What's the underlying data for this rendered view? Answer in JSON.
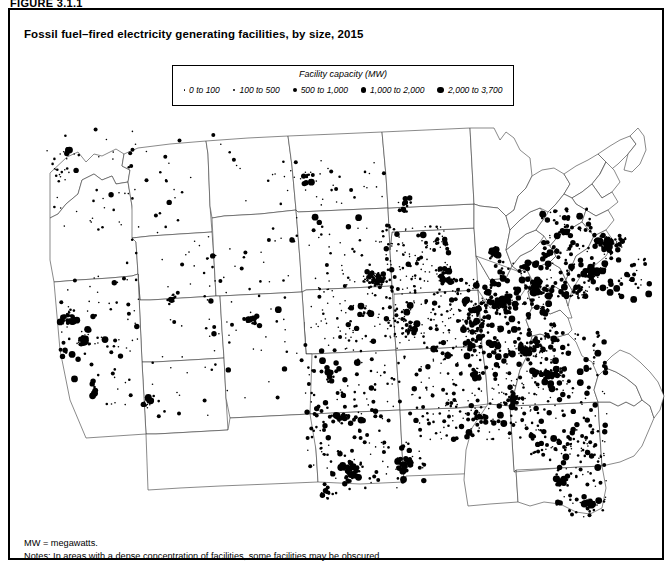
{
  "figure_label": "FIGURE 3.1.1",
  "title": "Fossil fuel–fired electricity generating facilities, by size, 2015",
  "legend": {
    "title": "Facility capacity (MW)",
    "items": [
      {
        "label": "0 to 100",
        "size": 1.6
      },
      {
        "label": "100 to 500",
        "size": 2.6
      },
      {
        "label": "500 to 1,000",
        "size": 4.0
      },
      {
        "label": "1,000 to 2,000",
        "size": 5.2
      },
      {
        "label": "2,000 to 3,700",
        "size": 6.6
      }
    ]
  },
  "notes": {
    "abbreviation": "MW = megawatts.",
    "note": "Notes: In areas with a dense concentration of facilities, some facilities may be obscured."
  },
  "colors": {
    "dot": "#000000",
    "state_border": "#3a3a3a",
    "country_outline": "#1a1a1a",
    "frame": "#000000",
    "background": "#ffffff"
  },
  "chart_data": {
    "type": "scatter",
    "title": "Fossil fuel–fired electricity generating facilities, by size, 2015",
    "xlabel": "",
    "ylabel": "",
    "projection": "conic United States (lower 48)",
    "legend_position": "top-center",
    "grid": false,
    "size_classes": [
      {
        "range_mw": [
          0,
          100
        ],
        "label": "0 to 100",
        "radius_px": 0.8
      },
      {
        "range_mw": [
          100,
          500
        ],
        "label": "100 to 500",
        "radius_px": 1.3
      },
      {
        "range_mw": [
          500,
          1000
        ],
        "label": "500 to 1,000",
        "radius_px": 2.0
      },
      {
        "range_mw": [
          1000,
          2000
        ],
        "label": "1,000 to 2,000",
        "radius_px": 2.7
      },
      {
        "range_mw": [
          2000,
          3700
        ],
        "label": "2,000 to 3,700",
        "radius_px": 3.4
      }
    ],
    "regions": [
      {
        "name": "Pacific Northwest",
        "density": "low",
        "approx_count": 40
      },
      {
        "name": "California",
        "density": "high",
        "approx_count": 190
      },
      {
        "name": "Desert Southwest",
        "density": "medium",
        "approx_count": 95
      },
      {
        "name": "Northern Rockies / Plains",
        "density": "very low",
        "approx_count": 55
      },
      {
        "name": "Midwest Corn Belt",
        "density": "very high",
        "approx_count": 300
      },
      {
        "name": "Texas Gulf Coast",
        "density": "very high",
        "approx_count": 210
      },
      {
        "name": "Southeast",
        "density": "high",
        "approx_count": 260
      },
      {
        "name": "Florida",
        "density": "high",
        "approx_count": 95
      },
      {
        "name": "Ohio Valley / Appalachia",
        "density": "very high",
        "approx_count": 320
      },
      {
        "name": "Northeast Corridor",
        "density": "very high",
        "approx_count": 340
      },
      {
        "name": "Great Lakes",
        "density": "high",
        "approx_count": 180
      }
    ],
    "clusters": [
      {
        "name": "Los Angeles Basin",
        "x": 0.105,
        "y": 0.68,
        "count": 46,
        "weight": "heavy"
      },
      {
        "name": "San Francisco Bay",
        "x": 0.072,
        "y": 0.505,
        "count": 30,
        "weight": "heavy"
      },
      {
        "name": "Central Valley",
        "x": 0.098,
        "y": 0.56,
        "count": 26,
        "weight": "medium"
      },
      {
        "name": "San Diego / Imperial",
        "x": 0.125,
        "y": 0.735,
        "count": 14,
        "weight": "medium"
      },
      {
        "name": "Phoenix",
        "x": 0.196,
        "y": 0.71,
        "count": 20,
        "weight": "heavy"
      },
      {
        "name": "Seattle / Puget Sound",
        "x": 0.072,
        "y": 0.1,
        "count": 12,
        "weight": "medium"
      },
      {
        "name": "Portland",
        "x": 0.062,
        "y": 0.155,
        "count": 9,
        "weight": "light"
      },
      {
        "name": "Salt Lake City",
        "x": 0.232,
        "y": 0.455,
        "count": 14,
        "weight": "medium"
      },
      {
        "name": "Denver / Front Range",
        "x": 0.352,
        "y": 0.505,
        "count": 20,
        "weight": "medium"
      },
      {
        "name": "Houston Ship Channel",
        "x": 0.508,
        "y": 0.875,
        "count": 38,
        "weight": "heavy"
      },
      {
        "name": "Dallas–Fort Worth",
        "x": 0.492,
        "y": 0.745,
        "count": 28,
        "weight": "heavy"
      },
      {
        "name": "Corpus Christi",
        "x": 0.47,
        "y": 0.93,
        "count": 12,
        "weight": "medium"
      },
      {
        "name": "Louisiana Gulf",
        "x": 0.59,
        "y": 0.86,
        "count": 32,
        "weight": "heavy"
      },
      {
        "name": "Chicago",
        "x": 0.66,
        "y": 0.4,
        "count": 40,
        "weight": "heavy"
      },
      {
        "name": "Detroit",
        "x": 0.723,
        "y": 0.345,
        "count": 26,
        "weight": "heavy"
      },
      {
        "name": "Ohio Valley",
        "x": 0.74,
        "y": 0.47,
        "count": 48,
        "weight": "heavy"
      },
      {
        "name": "Pittsburgh",
        "x": 0.79,
        "y": 0.43,
        "count": 30,
        "weight": "heavy"
      },
      {
        "name": "New York Metro",
        "x": 0.905,
        "y": 0.33,
        "count": 58,
        "weight": "heavy"
      },
      {
        "name": "Philadelphia / Delaware Valley",
        "x": 0.88,
        "y": 0.39,
        "count": 36,
        "weight": "heavy"
      },
      {
        "name": "Boston / New England",
        "x": 0.935,
        "y": 0.255,
        "count": 30,
        "weight": "heavy"
      },
      {
        "name": "Baltimore / DC",
        "x": 0.86,
        "y": 0.44,
        "count": 22,
        "weight": "medium"
      },
      {
        "name": "Atlanta",
        "x": 0.76,
        "y": 0.7,
        "count": 22,
        "weight": "medium"
      },
      {
        "name": "Tampa Bay",
        "x": 0.83,
        "y": 0.9,
        "count": 20,
        "weight": "heavy"
      },
      {
        "name": "South Florida",
        "x": 0.875,
        "y": 0.955,
        "count": 22,
        "weight": "heavy"
      },
      {
        "name": "Jacksonville",
        "x": 0.828,
        "y": 0.82,
        "count": 10,
        "weight": "medium"
      },
      {
        "name": "Carolinas Piedmont",
        "x": 0.82,
        "y": 0.64,
        "count": 30,
        "weight": "medium"
      },
      {
        "name": "Nashville / Tennessee Valley",
        "x": 0.7,
        "y": 0.64,
        "count": 24,
        "weight": "medium"
      },
      {
        "name": "St. Louis",
        "x": 0.6,
        "y": 0.53,
        "count": 20,
        "weight": "medium"
      },
      {
        "name": "Kansas City",
        "x": 0.53,
        "y": 0.49,
        "count": 16,
        "weight": "medium"
      },
      {
        "name": "Minneapolis",
        "x": 0.59,
        "y": 0.23,
        "count": 18,
        "weight": "medium"
      },
      {
        "name": "Milwaukee",
        "x": 0.645,
        "y": 0.32,
        "count": 14,
        "weight": "medium"
      },
      {
        "name": "Birmingham",
        "x": 0.705,
        "y": 0.745,
        "count": 16,
        "weight": "medium"
      },
      {
        "name": "Oklahoma City",
        "x": 0.47,
        "y": 0.65,
        "count": 14,
        "weight": "medium"
      },
      {
        "name": "Iowa / Nebraska farm belt",
        "x": 0.545,
        "y": 0.41,
        "count": 70,
        "weight": "light"
      },
      {
        "name": "North Dakota lignite",
        "x": 0.44,
        "y": 0.165,
        "count": 10,
        "weight": "medium"
      }
    ]
  }
}
